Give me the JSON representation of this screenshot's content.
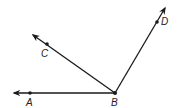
{
  "diagram": {
    "vertex": {
      "label": "B",
      "x": 115,
      "y": 93,
      "label_x": 111,
      "label_y": 106
    },
    "rays": [
      {
        "name": "BA",
        "point": {
          "label": "A",
          "x": 30,
          "y": 93,
          "label_x": 26,
          "label_y": 106
        },
        "tip": {
          "x": 14,
          "y": 93
        }
      },
      {
        "name": "BC",
        "point": {
          "label": "C",
          "x": 47,
          "y": 44,
          "label_x": 41,
          "label_y": 57
        },
        "tip": {
          "x": 33,
          "y": 35
        }
      },
      {
        "name": "BD",
        "point": {
          "label": "D",
          "x": 157,
          "y": 22,
          "label_x": 161,
          "label_y": 25
        },
        "tip": {
          "x": 165,
          "y": 8
        }
      }
    ],
    "colors": {
      "line": "#1a1a1a",
      "background": "#ffffff"
    }
  }
}
